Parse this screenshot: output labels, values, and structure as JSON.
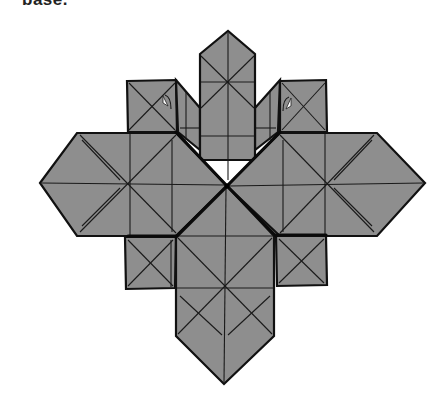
{
  "caption": {
    "text": "base."
  },
  "diagram": {
    "type": "origami-folding-diagram",
    "colors": {
      "paper": "#8e8e8e",
      "outline": "#111111",
      "background": "#ffffff",
      "marker": "#ffffff"
    },
    "parts": [
      {
        "name": "top-pillar",
        "tip": [
          228,
          31
        ]
      },
      {
        "name": "bottom-pillar",
        "tip": [
          224,
          384
        ]
      },
      {
        "name": "left-arm",
        "tip": [
          40,
          183
        ]
      },
      {
        "name": "right-arm",
        "tip": [
          425,
          183
        ]
      },
      {
        "name": "upper-left-square"
      },
      {
        "name": "upper-right-square"
      },
      {
        "name": "lower-left-square"
      },
      {
        "name": "lower-right-square"
      }
    ],
    "center": [
      227,
      186
    ],
    "markers": [
      {
        "name": "upper-left-pocket-marker",
        "at": [
          166,
          103
        ]
      },
      {
        "name": "upper-right-pocket-marker",
        "at": [
          288,
          105
        ]
      }
    ]
  }
}
